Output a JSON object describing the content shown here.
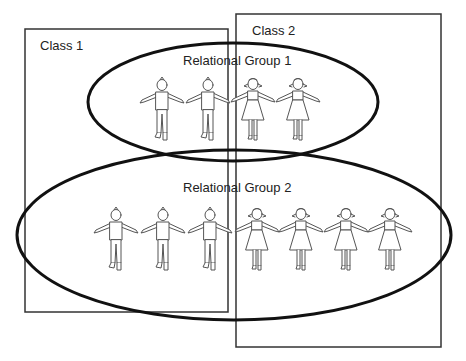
{
  "diagram": {
    "classes": [
      {
        "id": "class1",
        "label": "Class 1",
        "box": {
          "x": 25,
          "y": 29,
          "w": 203,
          "h": 283
        }
      },
      {
        "id": "class2",
        "label": "Class 2",
        "box": {
          "x": 236,
          "y": 14,
          "w": 205,
          "h": 333
        }
      }
    ],
    "groups": [
      {
        "id": "group1",
        "label": "Relational Group 1",
        "ellipse": {
          "cx": 233,
          "cy": 102,
          "rx": 145,
          "ry": 59
        },
        "members": [
          {
            "type": "boy",
            "x": 162,
            "y": 78
          },
          {
            "type": "boy",
            "x": 208,
            "y": 78
          },
          {
            "type": "girl",
            "x": 253,
            "y": 78
          },
          {
            "type": "girl",
            "x": 298,
            "y": 78
          }
        ]
      },
      {
        "id": "group2",
        "label": "Relational Group 2",
        "ellipse": {
          "cx": 234,
          "cy": 235,
          "rx": 217,
          "ry": 85
        },
        "members": [
          {
            "type": "boy",
            "x": 116,
            "y": 208
          },
          {
            "type": "boy",
            "x": 163,
            "y": 208
          },
          {
            "type": "boy",
            "x": 210,
            "y": 208
          },
          {
            "type": "girl",
            "x": 257,
            "y": 208
          },
          {
            "type": "girl",
            "x": 301,
            "y": 208
          },
          {
            "type": "girl",
            "x": 346,
            "y": 208
          },
          {
            "type": "girl",
            "x": 390,
            "y": 208
          }
        ]
      }
    ],
    "colors": {
      "line": "#111111",
      "box": "#333333",
      "figure": "#555555",
      "text": "#222222"
    }
  }
}
